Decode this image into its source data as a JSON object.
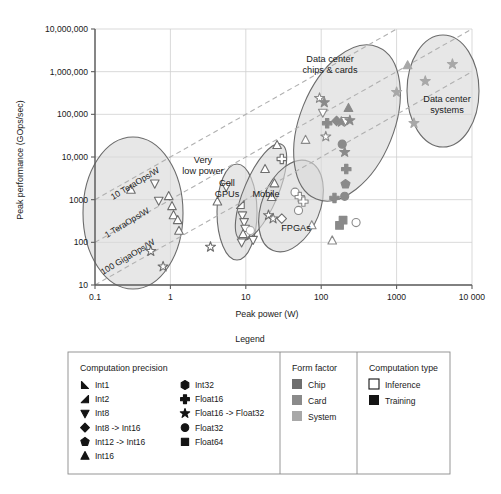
{
  "chart_data": {
    "type": "scatter",
    "title": "",
    "xlabel": "Peak power (W)",
    "ylabel": "Peak performance (GOps/sec)",
    "xscale": "log",
    "yscale": "log",
    "xlim": [
      0.1,
      10000
    ],
    "ylim": [
      10,
      10000000
    ],
    "xticks": [
      "0.1",
      "1",
      "10",
      "100",
      "1000",
      "10 000"
    ],
    "yticks": [
      "10",
      "100",
      "1000",
      "10,000",
      "100,000",
      "1,000,000",
      "10,000,000"
    ],
    "grid": true,
    "legend_position": "below-plot",
    "reference_lines": [
      {
        "label": "10 TeraOps/W",
        "slope": 1,
        "ops_per_watt": 10000
      },
      {
        "label": "1 TeraOps/W",
        "slope": 1,
        "ops_per_watt": 1000
      },
      {
        "label": "100 GigaOps/W",
        "slope": 1,
        "ops_per_watt": 100
      }
    ],
    "regions": [
      {
        "label": "Very low power",
        "cx": 3.0,
        "cy": 900,
        "note": "large ellipse, low power devices"
      },
      {
        "label": "Cell GPUs",
        "cx": 11,
        "cy": 500,
        "note": "narrow vertical ellipse"
      },
      {
        "label": "Mobile",
        "cx": 26,
        "cy": 1500,
        "note": "tilted narrow ellipse"
      },
      {
        "label": "FPGAs",
        "cx": 48,
        "cy": 400,
        "note": "tilted ellipse"
      },
      {
        "label": "Data center chips & cards",
        "cx": 200,
        "cy": 60000,
        "note": "large tilted ellipse"
      },
      {
        "label": "Data center systems",
        "cx": 3000,
        "cy": 500000,
        "note": "ellipse far right"
      }
    ],
    "series": [
      {
        "name": "Int1",
        "marker": "int1",
        "points": []
      },
      {
        "name": "Int2",
        "marker": "int2",
        "points": []
      },
      {
        "name": "Int8",
        "marker": "triangle-down",
        "points": []
      },
      {
        "name": "Int8 -> Int16",
        "marker": "diamond",
        "points": []
      },
      {
        "name": "Int12 -> Int16",
        "marker": "pentagon",
        "points": []
      },
      {
        "name": "Int16",
        "marker": "triangle-up",
        "points": []
      },
      {
        "name": "Int32",
        "marker": "hexagon",
        "points": []
      },
      {
        "name": "Float16",
        "marker": "plus",
        "points": []
      },
      {
        "name": "Float16 -> Float32",
        "marker": "star",
        "points": []
      },
      {
        "name": "Float32",
        "marker": "circle",
        "points": []
      },
      {
        "name": "Float64",
        "marker": "square",
        "points": []
      }
    ],
    "points": [
      {
        "x": 0.3,
        "y": 1700,
        "m": "triangle-up",
        "f": "chip",
        "t": "inference"
      },
      {
        "x": 0.62,
        "y": 2400,
        "m": "triangle-down",
        "f": "chip",
        "t": "inference"
      },
      {
        "x": 0.7,
        "y": 950,
        "m": "triangle-down",
        "f": "chip",
        "t": "inference"
      },
      {
        "x": 0.95,
        "y": 1200,
        "m": "triangle-up",
        "f": "chip",
        "t": "inference"
      },
      {
        "x": 1.05,
        "y": 700,
        "m": "triangle-up",
        "f": "chip",
        "t": "inference"
      },
      {
        "x": 1.1,
        "y": 430,
        "m": "triangle-up",
        "f": "chip",
        "t": "inference"
      },
      {
        "x": 1.25,
        "y": 330,
        "m": "triangle-up",
        "f": "chip",
        "t": "inference"
      },
      {
        "x": 1.3,
        "y": 185,
        "m": "triangle-up",
        "f": "chip",
        "t": "inference"
      },
      {
        "x": 0.55,
        "y": 62,
        "m": "star",
        "f": "chip",
        "t": "inference"
      },
      {
        "x": 0.8,
        "y": 27,
        "m": "star",
        "f": "chip",
        "t": "inference"
      },
      {
        "x": 3.4,
        "y": 78,
        "m": "star",
        "f": "chip",
        "t": "inference"
      },
      {
        "x": 5.5,
        "y": 2000,
        "m": "triangle-down",
        "f": "chip",
        "t": "inference"
      },
      {
        "x": 4.2,
        "y": 900,
        "m": "triangle-up",
        "f": "chip",
        "t": "inference"
      },
      {
        "x": 8.5,
        "y": 760,
        "m": "int2",
        "f": "chip",
        "t": "inference"
      },
      {
        "x": 9.0,
        "y": 430,
        "m": "triangle-down",
        "f": "chip",
        "t": "inference"
      },
      {
        "x": 9.5,
        "y": 300,
        "m": "triangle-down",
        "f": "chip",
        "t": "inference"
      },
      {
        "x": 9.8,
        "y": 210,
        "m": "triangle-down",
        "f": "chip",
        "t": "inference"
      },
      {
        "x": 10.5,
        "y": 150,
        "m": "triangle-down",
        "f": "chip",
        "t": "inference"
      },
      {
        "x": 9.2,
        "y": 155,
        "m": "triangle-up",
        "f": "chip",
        "t": "inference"
      },
      {
        "x": 8.8,
        "y": 100,
        "m": "triangle-down",
        "f": "chip",
        "t": "inference"
      },
      {
        "x": 11.5,
        "y": 190,
        "m": "circle",
        "f": "system",
        "t": "inference"
      },
      {
        "x": 12.5,
        "y": 115,
        "m": "triangle-down",
        "f": "chip",
        "t": "inference"
      },
      {
        "x": 18,
        "y": 5200,
        "m": "triangle-up",
        "f": "chip",
        "t": "inference"
      },
      {
        "x": 26,
        "y": 19000,
        "m": "triangle-up",
        "f": "chip",
        "t": "inference"
      },
      {
        "x": 30,
        "y": 9000,
        "m": "plus",
        "f": "chip",
        "t": "inference"
      },
      {
        "x": 24,
        "y": 2400,
        "m": "triangle-up",
        "f": "chip",
        "t": "inference"
      },
      {
        "x": 22,
        "y": 1150,
        "m": "triangle-up",
        "f": "chip",
        "t": "inference"
      },
      {
        "x": 20,
        "y": 430,
        "m": "star",
        "f": "chip",
        "t": "inference"
      },
      {
        "x": 23,
        "y": 360,
        "m": "star",
        "f": "chip",
        "t": "inference"
      },
      {
        "x": 30,
        "y": 360,
        "m": "diamond",
        "f": "chip",
        "t": "inference"
      },
      {
        "x": 45,
        "y": 1500,
        "m": "circle",
        "f": "card",
        "t": "inference"
      },
      {
        "x": 52,
        "y": 1150,
        "m": "plus",
        "f": "card",
        "t": "inference"
      },
      {
        "x": 58,
        "y": 900,
        "m": "plus",
        "f": "card",
        "t": "inference"
      },
      {
        "x": 50,
        "y": 560,
        "m": "circle",
        "f": "card",
        "t": "inference"
      },
      {
        "x": 62,
        "y": 25000,
        "m": "triangle-up",
        "f": "card",
        "t": "inference"
      },
      {
        "x": 75,
        "y": 250,
        "m": "triangle-up",
        "f": "card",
        "t": "inference"
      },
      {
        "x": 95,
        "y": 240000,
        "m": "star",
        "f": "card",
        "t": "inference"
      },
      {
        "x": 110,
        "y": 190000,
        "m": "star",
        "f": "card",
        "t": "training"
      },
      {
        "x": 105,
        "y": 110000,
        "m": "triangle-down",
        "f": "card",
        "t": "inference"
      },
      {
        "x": 120,
        "y": 62000,
        "m": "plus",
        "f": "card",
        "t": "training"
      },
      {
        "x": 115,
        "y": 30000,
        "m": "star",
        "f": "card",
        "t": "inference"
      },
      {
        "x": 160,
        "y": 70000,
        "m": "diamond",
        "f": "card",
        "t": "training"
      },
      {
        "x": 185,
        "y": 66000,
        "m": "star",
        "f": "card",
        "t": "training"
      },
      {
        "x": 210,
        "y": 70000,
        "m": "triangle-down",
        "f": "card",
        "t": "inference"
      },
      {
        "x": 240,
        "y": 72000,
        "m": "star",
        "f": "card",
        "t": "training"
      },
      {
        "x": 230,
        "y": 140000,
        "m": "triangle-up",
        "f": "card",
        "t": "training"
      },
      {
        "x": 190,
        "y": 20000,
        "m": "circle",
        "f": "card",
        "t": "training"
      },
      {
        "x": 205,
        "y": 13000,
        "m": "star",
        "f": "card",
        "t": "training"
      },
      {
        "x": 215,
        "y": 5200,
        "m": "plus",
        "f": "card",
        "t": "training"
      },
      {
        "x": 210,
        "y": 2300,
        "m": "pentagon",
        "f": "card",
        "t": "training"
      },
      {
        "x": 205,
        "y": 1200,
        "m": "circle",
        "f": "card",
        "t": "training"
      },
      {
        "x": 150,
        "y": 1100,
        "m": "plus",
        "f": "card",
        "t": "training"
      },
      {
        "x": 195,
        "y": 330,
        "m": "square",
        "f": "card",
        "t": "training"
      },
      {
        "x": 175,
        "y": 250,
        "m": "square",
        "f": "card",
        "t": "training"
      },
      {
        "x": 290,
        "y": 290,
        "m": "circle",
        "f": "card",
        "t": "inference"
      },
      {
        "x": 140,
        "y": 110,
        "m": "triangle-up",
        "f": "card",
        "t": "inference"
      },
      {
        "x": 1400,
        "y": 1400000,
        "m": "triangle-up",
        "f": "system",
        "t": "training"
      },
      {
        "x": 5500,
        "y": 1500000,
        "m": "star",
        "f": "system",
        "t": "training"
      },
      {
        "x": 2400,
        "y": 600000,
        "m": "star",
        "f": "system",
        "t": "training"
      },
      {
        "x": 1000,
        "y": 330000,
        "m": "star",
        "f": "system",
        "t": "training"
      },
      {
        "x": 1700,
        "y": 62000,
        "m": "star",
        "f": "system",
        "t": "training"
      }
    ],
    "colors": {
      "chip": "#6e6e6e",
      "card": "#8a8a8a",
      "system": "#a8a8a8",
      "inference_fill": "#ffffff",
      "training_fill": "#141414",
      "region_fill": "#d9d9d9",
      "region_stroke": "#6b6b6b",
      "diagonal": "#b0b0b0",
      "grid": "#cfcfcf"
    }
  },
  "legend": {
    "title": "Legend",
    "groups": [
      {
        "heading": "Computation precision",
        "columns": [
          [
            {
              "label": "Int1",
              "marker": "int1"
            },
            {
              "label": "Int2",
              "marker": "int2"
            },
            {
              "label": "Int8",
              "marker": "triangle-down"
            },
            {
              "label": "Int8 -> Int16",
              "marker": "diamond"
            },
            {
              "label": "Int12 -> Int16",
              "marker": "pentagon"
            },
            {
              "label": "Int16",
              "marker": "triangle-up"
            }
          ],
          [
            {
              "label": "Int32",
              "marker": "hexagon"
            },
            {
              "label": "Float16",
              "marker": "plus"
            },
            {
              "label": "Float16 -> Float32",
              "marker": "star"
            },
            {
              "label": "Float32",
              "marker": "circle"
            },
            {
              "label": "Float64",
              "marker": "square"
            }
          ]
        ]
      },
      {
        "heading": "Form factor",
        "columns": [
          [
            {
              "label": "Chip",
              "swatch": "#6e6e6e"
            },
            {
              "label": "Card",
              "swatch": "#8a8a8a"
            },
            {
              "label": "System",
              "swatch": "#a8a8a8"
            }
          ]
        ]
      },
      {
        "heading": "Computation type",
        "columns": [
          [
            {
              "label": "Inference",
              "swatch": "#ffffff",
              "outlined": true
            },
            {
              "label": "Training",
              "swatch": "#141414"
            }
          ]
        ]
      }
    ]
  }
}
